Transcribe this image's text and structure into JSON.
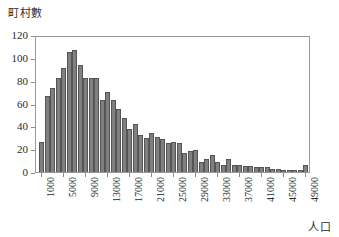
{
  "chart_data": {
    "type": "bar",
    "title": "",
    "subtitle": "",
    "ylabel": "町村數",
    "xlabel": "人口",
    "ylim": [
      0,
      120
    ],
    "ytick_step": 20,
    "yticks": [
      0,
      20,
      40,
      60,
      80,
      100,
      120
    ],
    "ytick_labels": [
      "0",
      "20",
      "40",
      "60",
      "80",
      "100",
      "120"
    ],
    "bin_width": 1000,
    "x_start": 1000,
    "xtick_step": 4000,
    "xticks": [
      1000,
      5000,
      9000,
      13000,
      17000,
      21000,
      25000,
      29000,
      33000,
      37000,
      41000,
      45000,
      49000
    ],
    "xtick_labels": [
      "1000",
      "5000",
      "9000",
      "13000",
      "17000",
      "21000",
      "25000",
      "29000",
      "33000",
      "37000",
      "41000",
      "45000",
      "49000"
    ],
    "grid": false,
    "legend": false,
    "legend_position": "none",
    "bar_color": "#808080",
    "bar_edge_color": "#555555",
    "frame_color": "#9a9a9a",
    "text_color": "#2b2b2b",
    "categories": [
      "1000",
      "2000",
      "3000",
      "4000",
      "5000",
      "6000",
      "7000",
      "8000",
      "9000",
      "10000",
      "11000",
      "12000",
      "13000",
      "14000",
      "15000",
      "16000",
      "17000",
      "18000",
      "19000",
      "20000",
      "21000",
      "22000",
      "23000",
      "24000",
      "25000",
      "26000",
      "27000",
      "28000",
      "29000",
      "30000",
      "31000",
      "32000",
      "33000",
      "34000",
      "35000",
      "36000",
      "37000",
      "38000",
      "39000",
      "40000",
      "41000",
      "42000",
      "43000",
      "44000",
      "45000",
      "46000",
      "47000",
      "48000",
      "49000"
    ],
    "values": [
      26,
      67,
      74,
      82,
      91,
      105,
      107,
      94,
      82,
      82,
      82,
      63,
      70,
      63,
      55,
      47,
      38,
      42,
      32,
      30,
      34,
      31,
      29,
      25,
      26,
      25,
      17,
      18,
      19,
      9,
      11,
      15,
      9,
      6,
      11,
      6,
      6,
      5,
      5,
      4,
      4,
      4,
      3,
      3,
      2,
      2,
      2,
      2,
      6
    ]
  }
}
